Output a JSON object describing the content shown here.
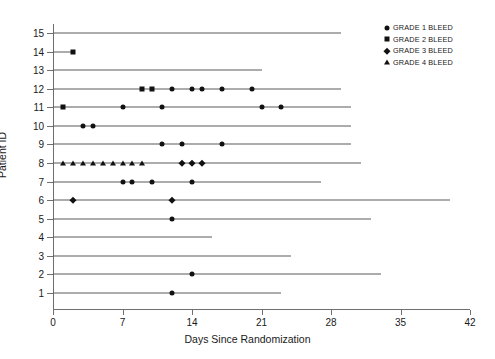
{
  "chart_data": {
    "type": "scatter",
    "title": "",
    "xlabel": "Days Since Randomization",
    "ylabel": "Patient ID",
    "xlim": [
      0,
      42
    ],
    "ylim": [
      0.5,
      15.5
    ],
    "xticks": [
      0,
      7,
      14,
      21,
      28,
      35,
      42
    ],
    "yticks": [
      1,
      2,
      3,
      4,
      5,
      6,
      7,
      8,
      9,
      10,
      11,
      12,
      13,
      14,
      15
    ],
    "grid": false,
    "legend_position": "top-right",
    "legend": [
      {
        "label": "GRADE 1 BLEED",
        "marker": "circle"
      },
      {
        "label": "GRADE 2 BLEED",
        "marker": "square"
      },
      {
        "label": "GRADE 3 BLEED",
        "marker": "diamond"
      },
      {
        "label": "GRADE 4 BLEED",
        "marker": "triangle"
      }
    ],
    "series": [
      {
        "patient": 15,
        "follow_up_end": 29,
        "events": []
      },
      {
        "patient": 14,
        "follow_up_end": 2,
        "events": [
          {
            "day": 2,
            "grade": 2
          }
        ]
      },
      {
        "patient": 13,
        "follow_up_end": 21,
        "events": []
      },
      {
        "patient": 12,
        "follow_up_end": 29,
        "events": [
          {
            "day": 9,
            "grade": 2
          },
          {
            "day": 10,
            "grade": 2
          },
          {
            "day": 12,
            "grade": 1
          },
          {
            "day": 14,
            "grade": 1
          },
          {
            "day": 15,
            "grade": 1
          },
          {
            "day": 17,
            "grade": 1
          },
          {
            "day": 20,
            "grade": 1
          }
        ]
      },
      {
        "patient": 11,
        "follow_up_end": 30,
        "events": [
          {
            "day": 1,
            "grade": 2
          },
          {
            "day": 7,
            "grade": 1
          },
          {
            "day": 11,
            "grade": 1
          },
          {
            "day": 21,
            "grade": 1
          },
          {
            "day": 23,
            "grade": 1
          }
        ]
      },
      {
        "patient": 10,
        "follow_up_end": 30,
        "events": [
          {
            "day": 3,
            "grade": 1
          },
          {
            "day": 4,
            "grade": 1
          }
        ]
      },
      {
        "patient": 9,
        "follow_up_end": 30,
        "events": [
          {
            "day": 11,
            "grade": 1
          },
          {
            "day": 13,
            "grade": 1
          },
          {
            "day": 17,
            "grade": 1
          }
        ]
      },
      {
        "patient": 8,
        "follow_up_end": 31,
        "events": [
          {
            "day": 1,
            "grade": 4
          },
          {
            "day": 2,
            "grade": 4
          },
          {
            "day": 3,
            "grade": 4
          },
          {
            "day": 4,
            "grade": 4
          },
          {
            "day": 5,
            "grade": 4
          },
          {
            "day": 6,
            "grade": 4
          },
          {
            "day": 7,
            "grade": 4
          },
          {
            "day": 8,
            "grade": 4
          },
          {
            "day": 9,
            "grade": 4
          },
          {
            "day": 13,
            "grade": 3
          },
          {
            "day": 14,
            "grade": 3
          },
          {
            "day": 15,
            "grade": 3
          }
        ]
      },
      {
        "patient": 7,
        "follow_up_end": 27,
        "events": [
          {
            "day": 7,
            "grade": 1
          },
          {
            "day": 8,
            "grade": 1
          },
          {
            "day": 10,
            "grade": 1
          },
          {
            "day": 14,
            "grade": 1
          }
        ]
      },
      {
        "patient": 6,
        "follow_up_end": 40,
        "events": [
          {
            "day": 2,
            "grade": 3
          },
          {
            "day": 12,
            "grade": 3
          }
        ]
      },
      {
        "patient": 5,
        "follow_up_end": 32,
        "events": [
          {
            "day": 12,
            "grade": 1
          }
        ]
      },
      {
        "patient": 4,
        "follow_up_end": 16,
        "events": []
      },
      {
        "patient": 3,
        "follow_up_end": 24,
        "events": []
      },
      {
        "patient": 2,
        "follow_up_end": 33,
        "events": [
          {
            "day": 14,
            "grade": 1
          }
        ]
      },
      {
        "patient": 1,
        "follow_up_end": 23,
        "events": [
          {
            "day": 12,
            "grade": 1
          }
        ]
      }
    ]
  }
}
